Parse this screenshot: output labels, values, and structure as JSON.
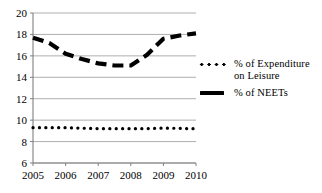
{
  "chart_data": {
    "type": "line",
    "title": "",
    "xlabel": "",
    "ylabel": "",
    "x": [
      2005,
      2006,
      2007,
      2008,
      2009,
      2010
    ],
    "xlim": [
      2005,
      2010
    ],
    "ylim": [
      6,
      20
    ],
    "ytick_labels": [
      "20",
      "18",
      "16",
      "14",
      "12",
      "10",
      "8",
      "6"
    ],
    "yticks": [
      20,
      18,
      16,
      14,
      12,
      10,
      8,
      6
    ],
    "xtick_labels": [
      "2005",
      "2006",
      "2007",
      "2008",
      "2009",
      "2010"
    ],
    "grid": true,
    "grid_color": "#a6a6a6",
    "legend_position": "right",
    "series": [
      {
        "name": "% of Expenditure on Leisure",
        "style": "dotted",
        "color": "#000000",
        "values": [
          9.3,
          9.3,
          9.2,
          9.2,
          9.25,
          9.2
        ],
        "dense_x": [
          2005,
          2005.2,
          2005.4,
          2005.6,
          2005.8,
          2006,
          2006.2,
          2006.4,
          2006.6,
          2006.8,
          2007,
          2007.2,
          2007.4,
          2007.6,
          2007.8,
          2008,
          2008.2,
          2008.4,
          2008.6,
          2008.8,
          2009,
          2009.2,
          2009.4,
          2009.6,
          2009.8,
          2010
        ],
        "dense_y": [
          9.3,
          9.3,
          9.3,
          9.3,
          9.3,
          9.3,
          9.28,
          9.26,
          9.24,
          9.22,
          9.2,
          9.2,
          9.2,
          9.2,
          9.2,
          9.2,
          9.2,
          9.2,
          9.22,
          9.24,
          9.25,
          9.25,
          9.24,
          9.22,
          9.2,
          9.2
        ]
      },
      {
        "name": "% of NEETs",
        "style": "dashed",
        "color": "#000000",
        "values": [
          17.7,
          16.2,
          15.3,
          15.1,
          17.6,
          18.1
        ],
        "dense_x": [
          2005,
          2005.5,
          2006,
          2006.5,
          2007,
          2007.5,
          2008,
          2008.5,
          2009,
          2009.5,
          2010
        ],
        "dense_y": [
          17.7,
          17.2,
          16.2,
          15.7,
          15.3,
          15.1,
          15.1,
          16.1,
          17.6,
          17.9,
          18.1
        ]
      }
    ]
  },
  "legend": {
    "entries": [
      {
        "label": "% of Expenditure\non Leisure",
        "marker": "dotted-line-marker"
      },
      {
        "label": "% of NEETs",
        "marker": "dashed-line-marker"
      }
    ]
  }
}
